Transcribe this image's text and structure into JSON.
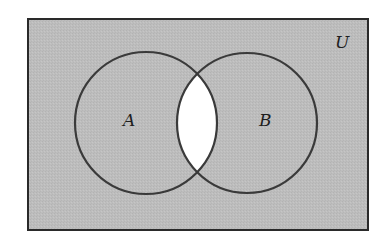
{
  "diagram": {
    "type": "venn",
    "universe_label": "U",
    "sets": [
      {
        "label": "A"
      },
      {
        "label": "B"
      }
    ],
    "shaded_region": "complement of A∩B (everything except the intersection)",
    "unshaded_region": "A∩B",
    "colors": {
      "shade": "#bcbcbc",
      "intersection": "#ffffff",
      "stroke": "#3a3a3a"
    }
  }
}
